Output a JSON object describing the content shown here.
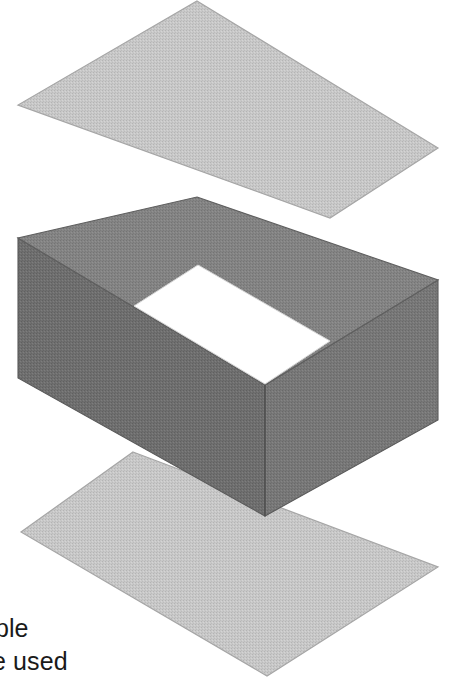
{
  "figure": {
    "type": "isometric-exploded-assembly",
    "background_color": "#ffffff",
    "parts": [
      {
        "name": "top-plate",
        "label": "Top plate (lid)",
        "fill": "#c6c6c6",
        "stroke": "#9a9a9a",
        "points": "197,1 438,148 330,218 18,105"
      },
      {
        "name": "box-rim-top-face",
        "label": "Box rim (upper face)",
        "fill": "#828282",
        "stroke": "#6e6e6e"
      },
      {
        "name": "box-wall-left",
        "label": "Box left outer wall",
        "fill": "#6a6a6a",
        "stroke": "#5c5c5c"
      },
      {
        "name": "box-wall-right",
        "label": "Box right outer wall",
        "fill": "#757575",
        "stroke": "#5c5c5c"
      },
      {
        "name": "box-cavity",
        "label": "Box interior opening",
        "fill": "#ffffff",
        "stroke": "#cfcfcf",
        "points": "198,265 330,341 265,384 134,306"
      },
      {
        "name": "bottom-plate",
        "label": "Bottom plate (base)",
        "fill": "#c2c2c2",
        "stroke": "#9a9a9a",
        "points": "133,452 438,567 267,676 21,532"
      }
    ],
    "geometry": {
      "box_outer_top": "197,197 438,280 265,385 18,238",
      "box_outer_left_wall": "18,238 265,385 265,516 18,378",
      "box_outer_right_wall": "265,385 438,280 438,420 265,516",
      "rim_inner_hole": "198,265 330,341 265,384 134,306"
    },
    "colors": {
      "plate_light_gray": "#c4c4c4",
      "box_dark_gray": "#6e6e6e",
      "box_mid_gray": "#828282",
      "cavity_white": "#ffffff",
      "text_black": "#1a1a1a"
    }
  },
  "caption": {
    "line_1": "mple",
    "line_2": "he used"
  }
}
